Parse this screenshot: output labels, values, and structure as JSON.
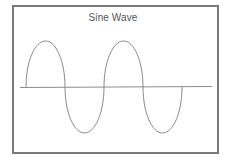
{
  "chart_data": {
    "type": "line",
    "title": "Sine Wave",
    "xlabel": "",
    "ylabel": "",
    "grid": false,
    "legend": null,
    "cycles": 2,
    "x": [
      0,
      0.5,
      1,
      1.5,
      2,
      2.5,
      3,
      3.5,
      4
    ],
    "x_unit": "pi",
    "values": [
      0,
      1,
      0,
      -1,
      0,
      1,
      0,
      -1,
      0
    ],
    "ylim": [
      -1,
      1
    ],
    "series": [
      {
        "name": "sin(x)",
        "x": [
          0,
          0.5,
          1,
          1.5,
          2,
          2.5,
          3,
          3.5,
          4
        ],
        "values": [
          0,
          1,
          0,
          -1,
          0,
          1,
          0,
          -1,
          0
        ]
      }
    ],
    "annotations": []
  },
  "colors": {
    "frame": "#7a7a7a",
    "axis": "#8c8c8c",
    "wave": "#8a8a8a",
    "title": "#555555",
    "background": "#ffffff"
  },
  "geometry": {
    "axis_y": 87,
    "axis_x_start": 20,
    "axis_x_end": 212,
    "wave_x_start": 26,
    "wave_x_end": 182,
    "amplitude_px": 46
  }
}
